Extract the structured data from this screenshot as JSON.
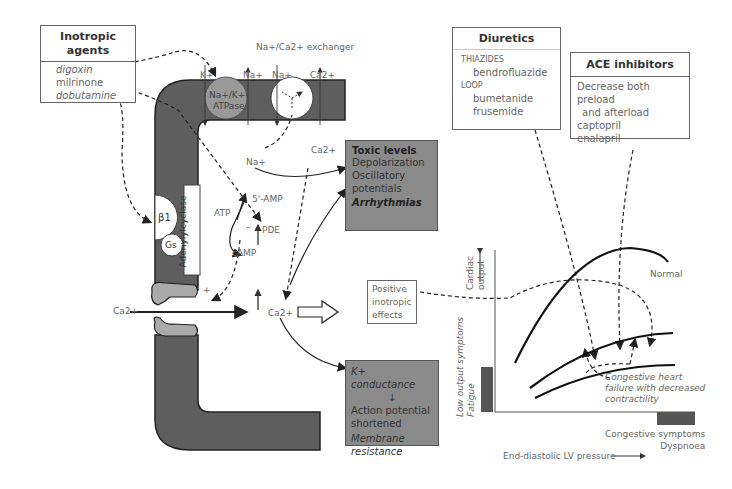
{
  "inotropic_agents": {
    "title_line1": "Inotropic",
    "title_line2": "agents",
    "items": [
      "digoxin",
      "milrinone",
      "dobutamine"
    ]
  },
  "membrane": {
    "exchanger_label": "Na+/Ca2+ exchanger",
    "ions_top": [
      "K+",
      "Na+",
      "Na+",
      "Ca2+"
    ],
    "pump_line1": "Na+/K+-",
    "pump_line2": "ATPase",
    "receptor": "β1",
    "g_protein": "Gs",
    "enzyme": "Adenylylcyclase"
  },
  "cytosol": {
    "na_up": "Na+",
    "ca_up": "Ca2+",
    "atp": "ATP",
    "camp": "cAMP",
    "amp5": "5'-AMP",
    "pde": "PDE",
    "minus": "–",
    "plus": "+",
    "ca_in": "Ca2+",
    "ca_center": "Ca2+"
  },
  "toxic_box": {
    "title": "Toxic levels",
    "lines": [
      "Depolarization",
      "Oscillatory",
      "potentials"
    ],
    "footer": "Arrhythmias"
  },
  "positive_box": {
    "lines": [
      "Positive",
      "inotropic",
      "effects"
    ]
  },
  "k_box": {
    "line1": "K+ conductance",
    "line2": "Action potential",
    "line3": "shortened",
    "line4": "Membrane",
    "line5": "resistance"
  },
  "diuretics": {
    "title": "Diuretics",
    "class1": "THIAZIDES",
    "drug1": "bendrofluazide",
    "class2": "LOOP",
    "drug2": "bumetanide",
    "drug3": "frusemide"
  },
  "ace": {
    "title": "ACE inhibitors",
    "line1": "Decrease both preload",
    "line2": "and afterload",
    "drug1": "captopril",
    "drug2": "enalapril"
  },
  "graph": {
    "y_label_line1": "Cardiac",
    "y_label_line2": "output",
    "low_output_line1": "Low output symptoms",
    "low_output_line2": "Fatigue",
    "normal_label": "Normal",
    "chf_line1": "Congestive heart",
    "chf_line2": "failure with decreased",
    "chf_line3": "contractility",
    "congestive_line1": "Congestive symptoms",
    "congestive_line2": "Dyspnoea",
    "x_label": "End-diastolic LV pressure"
  }
}
